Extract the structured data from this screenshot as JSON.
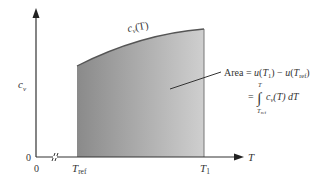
{
  "diagram": {
    "title": "",
    "y_axis": {
      "label": "c",
      "label_sub": "v",
      "origin_label": "0"
    },
    "x_axis": {
      "label": "T",
      "origin_label": "0",
      "break_marker": "≈"
    },
    "curve_label": {
      "main": "c",
      "sub": "v",
      "arg": "(T)"
    },
    "ticks": {
      "t_ref": {
        "main": "T",
        "sub": "ref"
      },
      "t_1": {
        "main": "T",
        "sub": "1"
      }
    },
    "annotation": {
      "line1_prefix": "Area = ",
      "line1_u1": "u",
      "line1_arg1_open": "(",
      "line1_T": "T",
      "line1_sub1": "1",
      "line1_close1": ")",
      "line1_minus": " − ",
      "line1_u2": "u",
      "line1_arg2_open": "(",
      "line1_T2": "T",
      "line1_sub2": "ref",
      "line1_close2": ")",
      "line2_eq": "=",
      "line2_integral": "∫",
      "line2_upper": "T",
      "line2_lower_main": "T",
      "line2_lower_sub": "ref",
      "line2_c": "c",
      "line2_c_sub": "v",
      "line2_arg": "(T) dT"
    },
    "colors": {
      "axis": "#333333",
      "curve": "#555555",
      "fill_left": "#8a8a8a",
      "fill_right": "#c8c8c8",
      "text": "#333333"
    }
  }
}
